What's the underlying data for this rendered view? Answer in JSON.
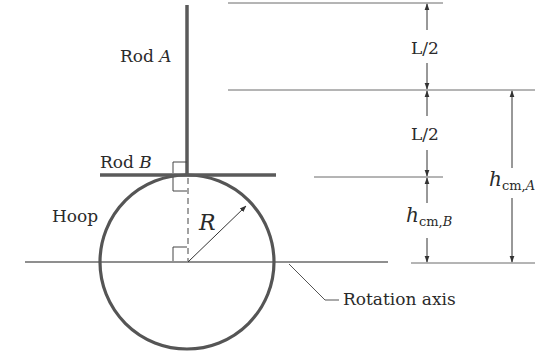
{
  "diagram": {
    "labels": {
      "rod_a_text": "Rod ",
      "rod_a_var": "A",
      "rod_b_text": "Rod ",
      "rod_b_var": "B",
      "hoop": "Hoop",
      "radius": "R",
      "rotation_axis": "Rotation axis",
      "half_length_upper": "L/2",
      "half_length_lower": "L/2",
      "h_cm_b_symbol": "h",
      "h_cm_b_sub": "cm,",
      "h_cm_b_sub_var": "B",
      "h_cm_a_symbol": "h",
      "h_cm_a_sub": "cm,",
      "h_cm_a_sub_var": "A"
    },
    "colors": {
      "rod": "#5a5a5a",
      "hoop": "#555555",
      "line": "#6a6a6a",
      "text": "#2a2a2a"
    }
  }
}
